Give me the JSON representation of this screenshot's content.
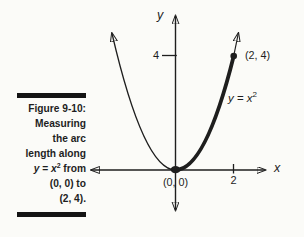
{
  "colors": {
    "ink": "#1e1e1e",
    "caption_rule": "#141414",
    "background": "#fbfbf8"
  },
  "caption": {
    "title": "Figure 9-10:",
    "lines": [
      [
        {
          "t": "Measuring"
        }
      ],
      [
        {
          "t": "the arc"
        }
      ],
      [
        {
          "t": "length along"
        }
      ],
      [
        {
          "t": "y",
          "s": "i"
        },
        {
          "t": " = "
        },
        {
          "t": "x",
          "s": "i"
        },
        {
          "t": "2",
          "s": "sup"
        },
        {
          "t": " from"
        }
      ],
      [
        {
          "t": "(0, 0) to"
        }
      ],
      [
        {
          "t": "(2, 4)."
        }
      ]
    ]
  },
  "graph": {
    "x_axis_label": "x",
    "y_axis_label": "y",
    "x_tick_label": "2",
    "y_tick_label": "4",
    "origin_label": "(0, 0)",
    "endpoint_label": "(2, 4)",
    "curve_label": [
      {
        "t": "y",
        "s": "i"
      },
      {
        "t": " = "
      },
      {
        "t": "x",
        "s": "i"
      },
      {
        "t": "2",
        "s": "sup"
      }
    ]
  },
  "chart_data": {
    "type": "line",
    "function": "y = x^2",
    "xlabel": "x",
    "ylabel": "y",
    "x_ticks": [
      2
    ],
    "y_ticks": [
      4
    ],
    "x_range_drawn": [
      -2.2,
      2.2
    ],
    "curve_samples": [
      [
        -2,
        4
      ],
      [
        -1,
        1
      ],
      [
        0,
        0
      ],
      [
        1,
        1
      ],
      [
        2,
        4
      ]
    ],
    "marked_points": [
      [
        0,
        0
      ],
      [
        2,
        4
      ]
    ],
    "highlight_segment": {
      "from": [
        0,
        0
      ],
      "to": [
        2,
        4
      ],
      "style": "bold"
    },
    "grid": false,
    "legend": false
  }
}
